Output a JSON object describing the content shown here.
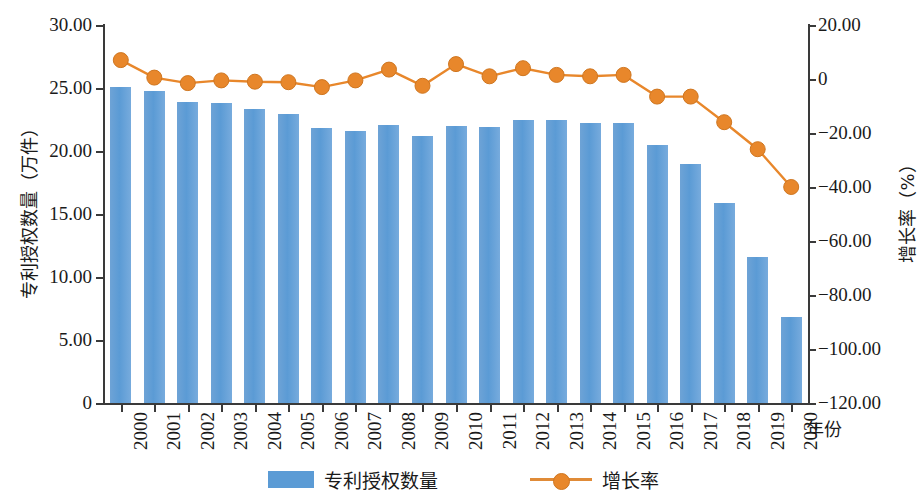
{
  "chart_data": {
    "type": "bar",
    "title": "",
    "xlabel": "年份",
    "categories": [
      "2000",
      "2001",
      "2002",
      "2003",
      "2004",
      "2005",
      "2006",
      "2007",
      "2008",
      "2009",
      "2010",
      "2011",
      "2012",
      "2013",
      "2014",
      "2015",
      "2016",
      "2017",
      "2018",
      "2019",
      "2020"
    ],
    "grid": false,
    "legend_position": "bottom",
    "series": [
      {
        "name": "专利授权数量",
        "type": "bar",
        "axis": "left",
        "unit": "万件",
        "color": "#5b9bd5",
        "values": [
          25.1,
          24.8,
          23.9,
          23.8,
          23.3,
          22.9,
          21.8,
          21.6,
          22.1,
          21.2,
          22.0,
          21.9,
          22.5,
          22.5,
          22.2,
          22.2,
          20.5,
          19.0,
          15.9,
          11.6,
          6.8
        ]
      },
      {
        "name": "增长率",
        "type": "line",
        "axis": "right",
        "unit": "%",
        "color": "#e8872b",
        "values": [
          7.0,
          0.5,
          -1.5,
          -0.5,
          -1.0,
          -1.2,
          -3.0,
          -0.5,
          3.5,
          -2.5,
          5.5,
          1.0,
          4.0,
          1.5,
          1.0,
          1.5,
          -6.5,
          -6.5,
          -16.0,
          -26.0,
          -40.0
        ]
      }
    ],
    "axes": {
      "left": {
        "label": "专利授权数量（万件）",
        "ticks": [
          "30.00",
          "25.00",
          "20.00",
          "15.00",
          "10.00",
          "5.00",
          "0"
        ],
        "values": [
          30,
          25,
          20,
          15,
          10,
          5,
          0
        ],
        "min": 0,
        "max": 30
      },
      "right": {
        "label": "增长率（%）",
        "ticks": [
          "20.00",
          "0",
          "−20.00",
          "−40.00",
          "−60.00",
          "−80.00",
          "−100.00",
          "−120.00"
        ],
        "values": [
          20,
          0,
          -20,
          -40,
          -60,
          -80,
          -100,
          -120
        ],
        "min": -120,
        "max": 20
      },
      "bottom": {
        "label": "年份"
      }
    },
    "legend": [
      {
        "label": "专利授权数量",
        "marker": "bar",
        "color": "#5b9bd5"
      },
      {
        "label": "增长率",
        "marker": "line-dot",
        "color": "#e8872b"
      }
    ]
  }
}
